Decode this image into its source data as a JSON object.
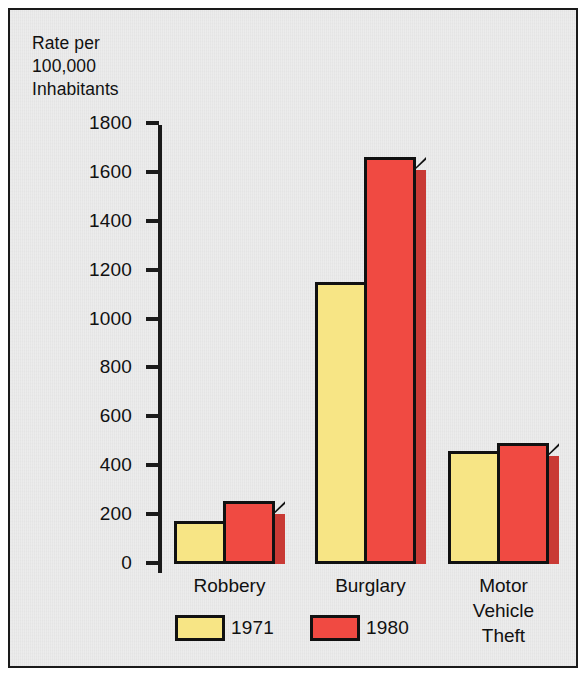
{
  "chart_data": {
    "type": "bar",
    "title": "",
    "axis_caption": "Rate per\n100,000\nInhabitants",
    "ylabel": "Rate per 100,000 Inhabitants",
    "xlabel": "",
    "categories": [
      "Robbery",
      "Burglary",
      "Motor\nVehicle\nTheft"
    ],
    "series": [
      {
        "name": "1971",
        "color": "#F7E585",
        "values": [
          163,
          1143,
          449
        ]
      },
      {
        "name": "1980",
        "color": "#F04A42",
        "values": [
          245,
          1653,
          482
        ]
      }
    ],
    "ylim": [
      0,
      1800
    ],
    "yticks": [
      0,
      200,
      400,
      600,
      800,
      1000,
      1200,
      1400,
      1600,
      1800
    ],
    "ytick_labels": [
      "0",
      "200",
      "400",
      "600",
      "800",
      "1000",
      "1200",
      "1400",
      "1600",
      "1800"
    ],
    "grid": false,
    "legend": {
      "position": "bottom",
      "entries": [
        "1971",
        "1980"
      ]
    },
    "style": {
      "background": "#ECECEC",
      "frame_color": "#1A1A1A",
      "bar_outline": "#111111",
      "shade_red": "#C93A35",
      "shade_yellow": "#D8C65F"
    }
  }
}
